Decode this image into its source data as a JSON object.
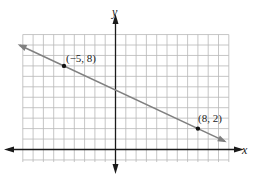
{
  "chart_data": {
    "type": "line",
    "title": "",
    "xlabel": "x",
    "ylabel": "y",
    "grid": true,
    "xlim": [
      -9,
      11
    ],
    "ylim": [
      -2,
      11
    ],
    "series": [
      {
        "name": "line through (-5, 8) and (8, 2)",
        "x": [
          -5,
          8
        ],
        "y": [
          8,
          2
        ],
        "slope": -0.4615,
        "arrows": "both ends"
      }
    ],
    "points": [
      {
        "x": -5,
        "y": 8,
        "label": "(−5, 8)"
      },
      {
        "x": 8,
        "y": 2,
        "label": "(8, 2)"
      }
    ]
  },
  "labels": {
    "x_axis": "x",
    "y_axis": "y",
    "point1": "(−5, 8)",
    "point2": "(8, 2)"
  },
  "colors": {
    "grid": "#b8b8b8",
    "axis": "#1a1a1a",
    "line": "#808080",
    "point": "#111111"
  }
}
